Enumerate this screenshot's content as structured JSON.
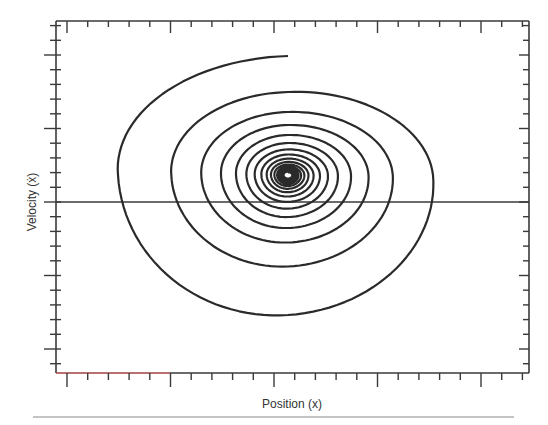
{
  "chart_data": {
    "type": "line",
    "title": "",
    "xlabel": "Position (x)",
    "ylabel": "Velocity (ẋ)",
    "grid": false,
    "legend": null,
    "x_tick_labels": [],
    "y_tick_labels": [],
    "plot_box_px": {
      "left": 56,
      "top": 21,
      "right": 529,
      "bottom": 373
    },
    "x_ticks_px": {
      "first_major": 67,
      "minor_spacing": 20.7,
      "minors_per_major": 5
    },
    "y_ticks_px": {
      "first_major": 55,
      "minor_spacing": 14.7,
      "minors_per_major": 5
    },
    "zero_velocity_line_y_px": 202,
    "spiral": {
      "start_px": [
        274,
        56
      ],
      "center_px": [
        288,
        175
      ],
      "turn_extremes_px": [
        {
          "top": 56,
          "left": 103,
          "bottom": 348,
          "right": 484
        },
        {
          "top": 92,
          "left": 163,
          "bottom": 282,
          "right": 416
        },
        {
          "top": 112,
          "left": 196,
          "bottom": 251,
          "right": 385
        },
        {
          "top": 125,
          "left": 217,
          "bottom": 234,
          "right": 363
        },
        {
          "top": 135,
          "left": 233,
          "bottom": 222,
          "right": 347
        }
      ],
      "decay_per_turn": 0.8,
      "turns": 16
    },
    "series": [
      {
        "name": "trajectory",
        "color": "#2a2a2a",
        "width": 2.2
      }
    ]
  },
  "colors": {
    "axis": "#3a3a3a",
    "axis_red_segment": "#a04040",
    "rule": "#c4c4c4"
  }
}
